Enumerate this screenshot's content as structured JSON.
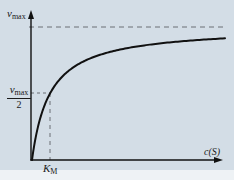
{
  "chart_data": {
    "type": "line",
    "title": "",
    "xlabel": "c(S)",
    "ylabel": "v",
    "y_annotations": [
      {
        "label": "v_max",
        "value": 1.0,
        "style": "dashed horizontal asymptote"
      },
      {
        "label": "v_max / 2",
        "value": 0.5,
        "style": "dashed guide to curve"
      }
    ],
    "x_annotations": [
      {
        "label": "K_M",
        "value": 1.0,
        "style": "dashed vertical guide from curve to x-axis"
      }
    ],
    "series": [
      {
        "name": "v = v_max * c(S) / (K_M + c(S))",
        "x": [
          0,
          0.25,
          0.5,
          1,
          2,
          3,
          4,
          6,
          8,
          10
        ],
        "values": [
          0,
          0.2,
          0.333,
          0.5,
          0.667,
          0.75,
          0.8,
          0.857,
          0.889,
          0.909
        ]
      }
    ],
    "xlim": [
      0,
      10
    ],
    "ylim": [
      0,
      1.15
    ],
    "grid": false,
    "legend": "none",
    "colors": {
      "background": "#d3dde6",
      "curve": "#111111",
      "axes": "#111111",
      "dashed": "#6a6f74"
    }
  },
  "labels": {
    "vmax_symbol": "v",
    "vmax_sub": "max",
    "half_symbol": "v",
    "half_sub": "max",
    "half_den": "2",
    "km_symbol": "K",
    "km_sub": "M",
    "x_axis": "c(S)"
  }
}
